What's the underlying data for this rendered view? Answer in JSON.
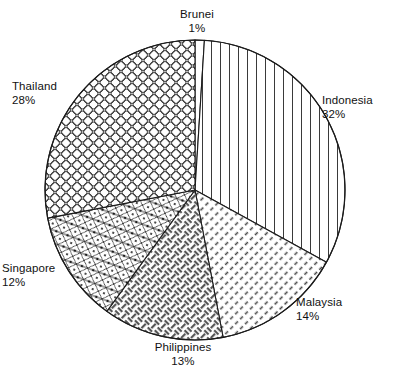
{
  "chart_data": {
    "type": "pie",
    "title": "",
    "xlabel": "",
    "ylabel": "",
    "legend_position": "none",
    "grid": false,
    "start_angle_deg": 0,
    "direction": "clockwise",
    "categories": [
      "Brunei",
      "Indonesia",
      "Malaysia",
      "Philippines",
      "Singapore",
      "Thailand"
    ],
    "values": [
      1,
      32,
      14,
      13,
      12,
      28
    ],
    "unit": "%",
    "slices": [
      {
        "label": "Brunei",
        "value": 1,
        "value_text": "1%",
        "pattern": "blank",
        "color": "#ffffff"
      },
      {
        "label": "Indonesia",
        "value": 32,
        "value_text": "32%",
        "pattern": "vertical-lines",
        "color": "#ffffff"
      },
      {
        "label": "Malaysia",
        "value": 14,
        "value_text": "14%",
        "pattern": "diagonal-hatch",
        "color": "#ffffff"
      },
      {
        "label": "Philippines",
        "value": 13,
        "value_text": "13%",
        "pattern": "basket-weave",
        "color": "#ffffff"
      },
      {
        "label": "Singapore",
        "value": 12,
        "value_text": "12%",
        "pattern": "triangle-lattice",
        "color": "#ffffff"
      },
      {
        "label": "Thailand",
        "value": 28,
        "value_text": "28%",
        "pattern": "circle-grid",
        "color": "#ffffff"
      }
    ]
  },
  "labels": {
    "brunei": {
      "name": "Brunei",
      "percent": "1%"
    },
    "indonesia": {
      "name": "Indonesia",
      "percent": "32%"
    },
    "malaysia": {
      "name": "Malaysia",
      "percent": "14%"
    },
    "philippines": {
      "name": "Philippines",
      "percent": "13%"
    },
    "singapore": {
      "name": "Singapore",
      "percent": "12%"
    },
    "thailand": {
      "name": "Thailand",
      "percent": "28%"
    }
  },
  "style": {
    "background": "#ffffff",
    "stroke": "#1b1b1b",
    "text": "#111111"
  },
  "geometry": {
    "cx": 195,
    "cy": 190,
    "r": 150
  }
}
